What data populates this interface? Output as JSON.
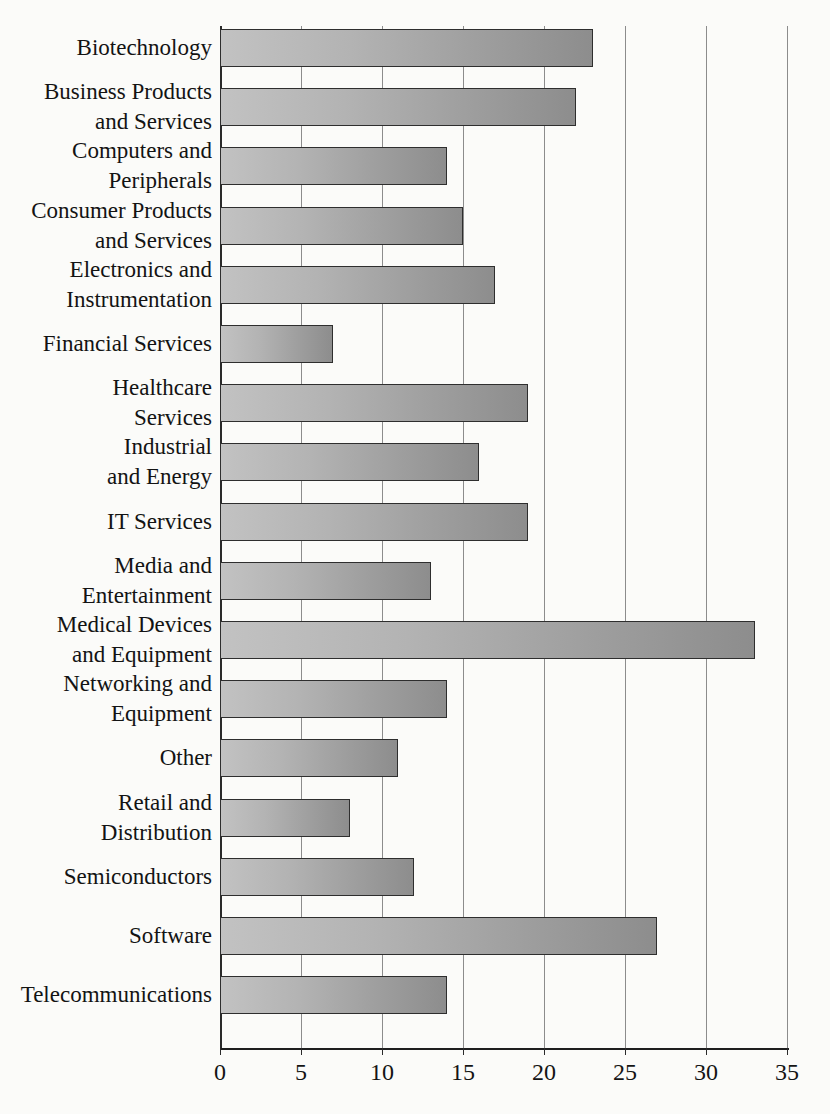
{
  "chart_data": {
    "type": "bar",
    "orientation": "horizontal",
    "title": "",
    "xlabel": "",
    "ylabel": "",
    "xlim": [
      0,
      35
    ],
    "xticks": [
      0,
      5,
      10,
      15,
      20,
      25,
      30,
      35
    ],
    "xtick_labels": [
      "0",
      "5",
      "10",
      "15",
      "20",
      "25",
      "30",
      "35"
    ],
    "grid": "vertical",
    "legend": "none",
    "categories": [
      "Biotechnology",
      "Business Products and Services",
      "Computers and Peripherals",
      "Consumer Products and Services",
      "Electronics and Instrumentation",
      "Financial Services",
      "Healthcare Services",
      "Industrial and Energy",
      "IT Services",
      "Media and Entertainment",
      "Medical Devices and Equipment",
      "Networking and Equipment",
      "Other",
      "Retail and Distribution",
      "Semiconductors",
      "Software",
      "Telecommunications"
    ],
    "category_label_lines": [
      [
        "Biotechnology"
      ],
      [
        "Business Products",
        "and Services"
      ],
      [
        "Computers and",
        "Peripherals"
      ],
      [
        "Consumer Products",
        "and Services"
      ],
      [
        "Electronics and",
        "Instrumentation"
      ],
      [
        "Financial Services"
      ],
      [
        "Healthcare",
        "Services"
      ],
      [
        "Industrial",
        "and Energy"
      ],
      [
        "IT Services"
      ],
      [
        "Media and",
        "Entertainment"
      ],
      [
        "Medical Devices",
        "and Equipment"
      ],
      [
        "Networking and",
        "Equipment"
      ],
      [
        "Other"
      ],
      [
        "Retail and",
        "Distribution"
      ],
      [
        "Semiconductors"
      ],
      [
        "Software"
      ],
      [
        "Telecommunications"
      ]
    ],
    "values": [
      23,
      22,
      14,
      15,
      17,
      7,
      19,
      16,
      19,
      13,
      33,
      14,
      11,
      8,
      12,
      27,
      14
    ],
    "colors": {
      "bar_fill_light": "#c2c2c2",
      "bar_fill_dark": "#8d8d8d",
      "bar_border": "#2e2e2e",
      "gridline": "#8c8c8c",
      "axis": "#1e1e1e",
      "background": "#fbfbf9",
      "text": "#131313"
    }
  }
}
